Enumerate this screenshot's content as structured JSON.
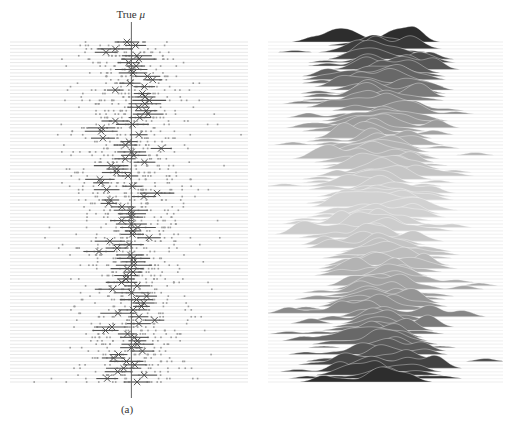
{
  "figure": {
    "captions": {
      "a": "(a)",
      "b": "(b)"
    },
    "annotation": {
      "prefix": "True ",
      "symbol": "μ"
    }
  },
  "chart_data": [
    {
      "type": "scatter",
      "panel": "(a)",
      "title": "",
      "description": "Stacked rows of sampled data points (small grey dots) per trial, each row with a horizontal interval line and an X marker for the estimated mean; a vertical line marks the true mean.",
      "annotation": "True μ",
      "xlabel": "",
      "ylabel": "",
      "grid": "horizontal row lines",
      "n_rows": 100,
      "true_mu_x_fraction": 0.51,
      "estimate_spread_fraction": 0.06,
      "point_spread_fraction": 0.22,
      "colors": {
        "points": "#9a9a9a",
        "intervals": "#555555",
        "markers": "#444444",
        "row_lines": "#d6d6d6",
        "true_mu_line": "#555555"
      }
    },
    {
      "type": "area",
      "panel": "(b)",
      "title": "",
      "description": "Ridgeline plot: 100 stacked kernel density curves, filled grey; darker at top and bottom rows, lighter in the middle.",
      "xlabel": "",
      "ylabel": "",
      "grid": "horizontal baseline per ridge",
      "n_rows": 100,
      "center_x_fraction": 0.47,
      "fill_shade_top": "#2e2e2e",
      "fill_shade_middle": "#cfcfcf",
      "fill_shade_bottom": "#2e2e2e",
      "baseline_color": "#d6d6d6"
    }
  ]
}
